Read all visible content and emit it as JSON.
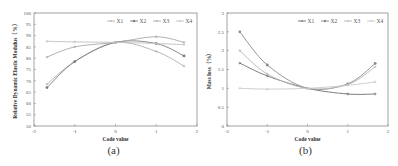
{
  "chart_data": [
    {
      "type": "line",
      "panel_label": "(a)",
      "title": "",
      "xlabel": "Code value",
      "ylabel": "Relative Dynamic Elastic Modulus（%）",
      "xlim": [
        -2,
        2
      ],
      "ylim": [
        50,
        100
      ],
      "xticks": [
        -2,
        -1,
        0,
        1,
        2
      ],
      "yticks": [
        50,
        55,
        60,
        65,
        70,
        75,
        80,
        85,
        90,
        95,
        100
      ],
      "grid": false,
      "legend_position": "top-right",
      "x": [
        -1.682,
        -1,
        0,
        1,
        1.682
      ],
      "series": [
        {
          "name": "X1",
          "values": [
            68.5,
            78.5,
            87,
            83,
            76.5
          ],
          "color": "#b0b0b0",
          "marker": "cross"
        },
        {
          "name": "X2",
          "values": [
            67,
            78.5,
            87,
            86.5,
            81
          ],
          "color": "#7a7a7a",
          "marker": "star"
        },
        {
          "name": "X3",
          "values": [
            80.5,
            85,
            87,
            89.5,
            87
          ],
          "color": "#a8a8a8",
          "marker": "cross"
        },
        {
          "name": "X4",
          "values": [
            87.5,
            87.2,
            87,
            86.5,
            86
          ],
          "color": "#c0c0c0",
          "marker": "cross"
        }
      ]
    },
    {
      "type": "line",
      "panel_label": "(b)",
      "title": "",
      "xlabel": "Code value",
      "ylabel": "Mass loss（%）",
      "xlim": [
        -2,
        2
      ],
      "ylim": [
        0,
        3
      ],
      "xticks": [
        -2,
        -1,
        0,
        1,
        2
      ],
      "yticks": [
        0,
        0.5,
        1,
        1.5,
        2,
        2.5,
        3
      ],
      "grid": false,
      "legend_position": "top-right",
      "x": [
        -1.682,
        -1,
        0,
        1,
        1.682
      ],
      "series": [
        {
          "name": "X1",
          "values": [
            1.67,
            1.33,
            1.0,
            0.85,
            0.85
          ],
          "color": "#6e6e6e",
          "marker": "cross"
        },
        {
          "name": "X2",
          "values": [
            2.5,
            1.62,
            1.0,
            1.12,
            1.66
          ],
          "color": "#8a8a8a",
          "marker": "star"
        },
        {
          "name": "X3",
          "values": [
            2.0,
            1.38,
            1.0,
            1.1,
            1.57
          ],
          "color": "#b5b5b5",
          "marker": "cross"
        },
        {
          "name": "X4",
          "values": [
            1.0,
            0.98,
            1.0,
            1.08,
            1.17
          ],
          "color": "#c8c8c8",
          "marker": "cross"
        }
      ]
    }
  ]
}
